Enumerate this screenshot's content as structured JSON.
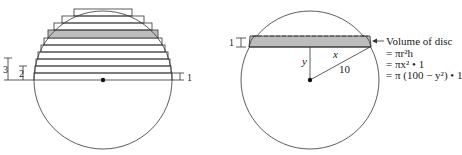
{
  "left_figure": {
    "labels": {
      "dim_3": "3",
      "dim_2": "2",
      "dim_1": "1"
    },
    "circle": {
      "cx": 103,
      "cy": 80,
      "r": 69
    },
    "slab_count": 10,
    "shaded_slab_index": 6,
    "colors": {
      "stroke": "#333333",
      "shade": "#bdbdbd"
    }
  },
  "right_figure": {
    "labels": {
      "thickness": "1",
      "x": "x",
      "y": "y",
      "radius": "10"
    },
    "circle": {
      "cx": 310,
      "cy": 80,
      "r": 69
    },
    "annotation": {
      "title": "Volume of disc",
      "line1": "= πr²h",
      "line2": "= πx² • 1",
      "line3": "= π (100 − y²) • 1"
    },
    "colors": {
      "stroke": "#333333",
      "shade": "#bdbdbd"
    }
  }
}
